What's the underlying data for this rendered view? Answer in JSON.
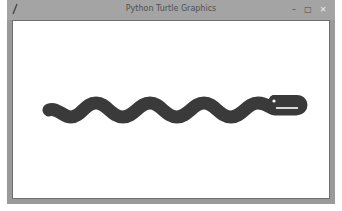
{
  "window": {
    "title": "Python Turtle Graphics",
    "app_icon": "feather-pen-icon",
    "controls": {
      "minimize": "–",
      "maximize": "□",
      "close": "✕"
    }
  },
  "canvas": {
    "background": "#ffffff",
    "drawing": {
      "shape": "snake",
      "color": "#3a3a3a",
      "stroke_width": 13,
      "eye_color": "#ffffff"
    }
  }
}
